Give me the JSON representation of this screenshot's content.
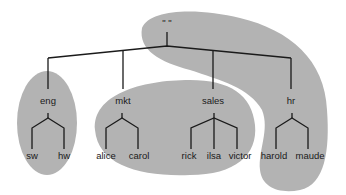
{
  "diagram": {
    "type": "tree",
    "colors": {
      "region_fill": "#b3b3b3",
      "line": "#1a1a1a",
      "background": "#ffffff"
    },
    "root": {
      "label": "\" \""
    },
    "groups": [
      {
        "label": "eng",
        "children": [
          "sw",
          "hw"
        ]
      },
      {
        "label": "mkt",
        "children": [
          "alice",
          "carol"
        ]
      },
      {
        "label": "sales",
        "children": [
          "rick",
          "ilsa",
          "victor"
        ]
      },
      {
        "label": "hr",
        "children": [
          "harold",
          "maude"
        ]
      }
    ],
    "regions": [
      {
        "name": "root-hr-region",
        "covers": [
          "\" \"",
          "sales",
          "hr",
          "harold",
          "maude"
        ]
      },
      {
        "name": "eng-region",
        "covers": [
          "eng",
          "sw",
          "hw"
        ]
      },
      {
        "name": "mkt-sales-region",
        "covers": [
          "mkt",
          "alice",
          "carol",
          "rick",
          "ilsa",
          "victor"
        ]
      }
    ]
  }
}
